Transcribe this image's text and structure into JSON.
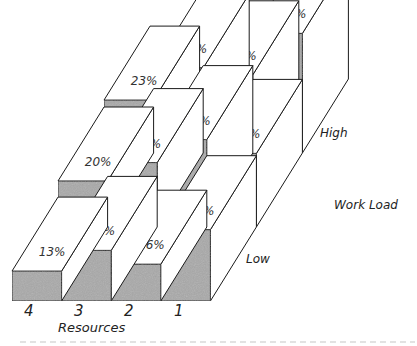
{
  "chart_data": {
    "type": "bar",
    "subtype": "3d-isometric-grouped",
    "title": "",
    "xlabel": "Resources",
    "ylabel": "Work Load",
    "categories": [
      "4",
      "3",
      "2",
      "1"
    ],
    "series": [
      {
        "name": "Low",
        "values": [
          13,
          22,
          16,
          31
        ]
      },
      {
        "name": "Medium",
        "values": [
          20,
          28,
          38,
          32
        ]
      },
      {
        "name": "High",
        "values": [
          23,
          37,
          34,
          52
        ]
      }
    ],
    "value_labels": [
      [
        "13%",
        "22%",
        "16%",
        "31%"
      ],
      [
        "20%",
        "28%",
        "38%",
        "32%"
      ],
      [
        "23%",
        "37%",
        "34%",
        "52%"
      ]
    ],
    "depth_axis_labels": {
      "front": "Low",
      "back": "High"
    },
    "unit": "%",
    "grid": false,
    "legend": "none"
  },
  "labels": {
    "x_title": "Resources",
    "z_title": "Work Load",
    "low": "Low",
    "high": "High",
    "x_ticks": [
      "4",
      "3",
      "2",
      "1"
    ]
  },
  "colors": {
    "front_face": "#a9a9a9",
    "top_face": "#ffffff",
    "side_face": "#ffffff",
    "stroke": "#1a1a1a"
  }
}
